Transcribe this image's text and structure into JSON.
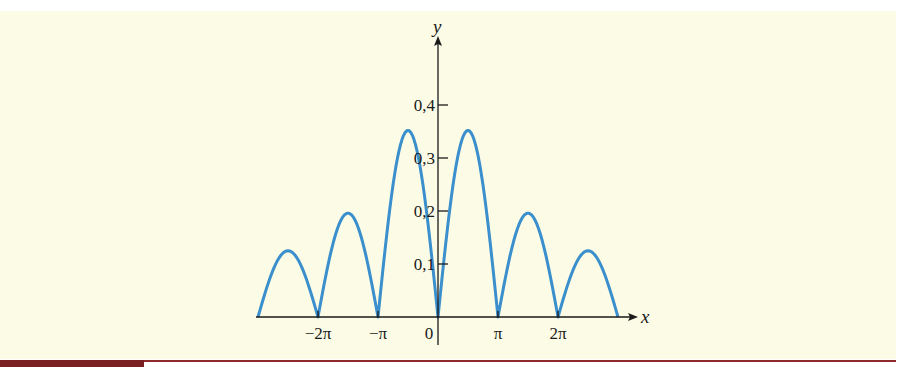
{
  "colors": {
    "background": "#fcfce6",
    "curve": "#3a8fcc",
    "axis": "#1a1a1a",
    "footer_bar": "#7a1f22"
  },
  "chart_data": {
    "type": "line",
    "title": "",
    "xlabel": "x",
    "ylabel": "y",
    "x_ticks": [
      {
        "value": -6.2832,
        "label": "−2π"
      },
      {
        "value": -3.1416,
        "label": "−π"
      },
      {
        "value": 0,
        "label": "0"
      },
      {
        "value": 3.1416,
        "label": "π"
      },
      {
        "value": 6.2832,
        "label": "2π"
      }
    ],
    "y_ticks": [
      {
        "value": 0.1,
        "label": "0,1"
      },
      {
        "value": 0.2,
        "label": "0,2"
      },
      {
        "value": 0.3,
        "label": "0,3"
      },
      {
        "value": 0.4,
        "label": "0,4"
      }
    ],
    "xlim": [
      -9.4248,
      9.4248
    ],
    "ylim": [
      0,
      0.45
    ],
    "grid": false,
    "legend": null,
    "series": [
      {
        "name": "y",
        "description": "non-negative oscillating curve, zeros at multiples of π, peaks decaying away from origin",
        "x": [
          -9.4248,
          -7.854,
          -6.2832,
          -4.7124,
          -3.1416,
          -1.5708,
          0,
          1.5708,
          3.1416,
          4.7124,
          6.2832,
          7.854,
          9.4248
        ],
        "y": [
          0,
          0.125,
          0,
          0.196,
          0,
          0.352,
          0,
          0.352,
          0,
          0.196,
          0,
          0.125,
          0
        ]
      }
    ]
  }
}
